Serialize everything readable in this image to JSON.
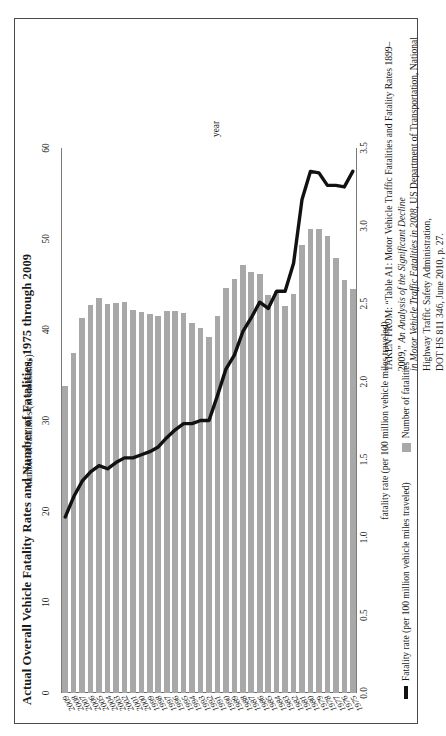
{
  "figure": {
    "title": "Actual Overall Vehicle Fatality Rates and Number of Fatalities, 1975 through 2009",
    "category_axis_caption": "year",
    "top_axis_caption": "number of fatalities (in thousands)",
    "bottom_axis_caption": "fatality rate (per 100 million vehicle miles traveled)",
    "legend": {
      "rate_label": "Fatality rate (per 100 million vehicle miles traveled)",
      "fatalities_label": "Number of fatalities"
    },
    "source": {
      "line1_a": "TAKEN FROM: “Table A1: Motor Vehicle Traffic Fatalities and Fatality Rates 1899–2009,” ",
      "line1_b": "An Analysis of the Significant Decline",
      "line2_a": "in Motor Vehicle Traffic Fatalities in 2008",
      "line2_b": ", US Department of Transportation, National Highway Traffic Safety Administration,",
      "line3": "DOT HS 811 346, June 2010, p. 27."
    },
    "colors": {
      "bar": "#a8a8a8",
      "line": "#111111",
      "axis": "#7a7a7a",
      "border": "#4a4a4a"
    }
  },
  "chart_data": {
    "type": "bar",
    "title": "Actual Overall Vehicle Fatality Rates and Number of Fatalities, 1975 through 2009",
    "orientation": "horizontal",
    "xlabel": "number of fatalities (in thousands)",
    "xlabel_secondary": "fatality rate (per 100 million vehicle miles traveled)",
    "ylabel": "year",
    "grid": false,
    "legend_position": "bottom-left",
    "categories": [
      "2009",
      "2008",
      "2007",
      "2006",
      "2005",
      "2004",
      "2003",
      "2002",
      "2001",
      "2000",
      "1999",
      "1998",
      "1997",
      "1996",
      "1995",
      "1994",
      "1993",
      "1992",
      "1991",
      "1990",
      "1989",
      "1988",
      "1987",
      "1986",
      "1985",
      "1984",
      "1983",
      "1982",
      "1981",
      "1980",
      "1979",
      "1978",
      "1977",
      "1976",
      "1975"
    ],
    "series": [
      {
        "name": "Number of fatalities",
        "type": "bar",
        "unit": "thousands",
        "axis": "top",
        "xlim": [
          0,
          60
        ],
        "xticks": [
          0,
          10,
          20,
          30,
          40,
          50,
          60
        ],
        "values": [
          33.8,
          37.4,
          41.3,
          42.7,
          43.5,
          42.8,
          42.9,
          43.0,
          42.2,
          41.9,
          41.7,
          41.5,
          42.0,
          42.1,
          41.8,
          40.7,
          40.2,
          39.2,
          41.5,
          44.6,
          45.6,
          47.1,
          46.4,
          46.1,
          43.8,
          44.3,
          42.6,
          43.9,
          49.3,
          51.1,
          51.1,
          50.3,
          47.9,
          45.5,
          44.5
        ]
      },
      {
        "name": "Fatality rate (per 100 million vehicle miles traveled)",
        "type": "line",
        "unit": "per 100 million VMT",
        "axis": "bottom",
        "xlim": [
          0,
          3.5
        ],
        "xticks": [
          0.0,
          0.5,
          1.0,
          1.5,
          2.0,
          2.5,
          3.0,
          3.5
        ],
        "values": [
          1.13,
          1.26,
          1.36,
          1.42,
          1.46,
          1.44,
          1.48,
          1.51,
          1.51,
          1.53,
          1.55,
          1.58,
          1.64,
          1.69,
          1.73,
          1.73,
          1.75,
          1.75,
          1.91,
          2.08,
          2.17,
          2.32,
          2.41,
          2.51,
          2.47,
          2.58,
          2.58,
          2.76,
          3.17,
          3.35,
          3.34,
          3.26,
          3.26,
          3.25,
          3.35
        ]
      }
    ]
  }
}
